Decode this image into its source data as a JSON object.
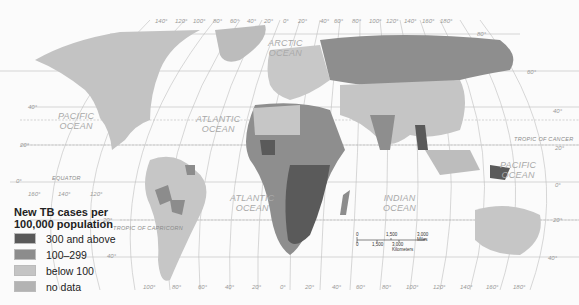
{
  "legend": {
    "title": "New TB cases per 100,000 population",
    "items": [
      {
        "label": "300 and above",
        "color": "#595959"
      },
      {
        "label": "100–299",
        "color": "#8c8c8c"
      },
      {
        "label": "below 100",
        "color": "#c4c4c4"
      },
      {
        "label": "no data",
        "color": "#b3b3b3"
      }
    ]
  },
  "oceans": {
    "pacific_north": [
      "PACIFIC",
      "OCEAN"
    ],
    "pacific_south": [
      "PACIFIC",
      "OCEAN"
    ],
    "atlantic_north": [
      "ATLANTIC",
      "OCEAN"
    ],
    "atlantic_south": [
      "ATLANTIC",
      "OCEAN"
    ],
    "arctic": [
      "ARCTIC",
      "OCEAN"
    ],
    "indian": [
      "INDIAN",
      "OCEAN"
    ]
  },
  "lines": {
    "equator": "EQUATOR",
    "tropic_cancer": "TROPIC OF CANCER",
    "tropic_capricorn": "TROPIC OF CAPRICORN"
  },
  "scale_bar": {
    "miles": [
      "0",
      "1,500",
      "3,000 Miles"
    ],
    "km": [
      "0",
      "1,500",
      "3,000 Kilometers"
    ]
  },
  "top_longitudes": [
    "140°",
    "120°",
    "100°",
    "80°",
    "60°",
    "40°",
    "20°",
    "0°",
    "20°",
    "40°",
    "60°",
    "80°",
    "100°",
    "120°",
    "140°",
    "160°",
    "180°"
  ],
  "bottom_longitudes": [
    "100°",
    "80°",
    "60°",
    "40°",
    "20°",
    "0°",
    "20°",
    "40°",
    "60°",
    "80°",
    "100°",
    "120°",
    "140°",
    "160°",
    "180°"
  ],
  "left_longitudes": [
    "160°",
    "140°",
    "120°"
  ],
  "left_latitudes": [
    "40°",
    "20°",
    "0°",
    "20°",
    "40°"
  ],
  "right_latitudes": [
    "80°",
    "60°",
    "40°",
    "20°",
    "0°",
    "20°",
    "40°"
  ]
}
